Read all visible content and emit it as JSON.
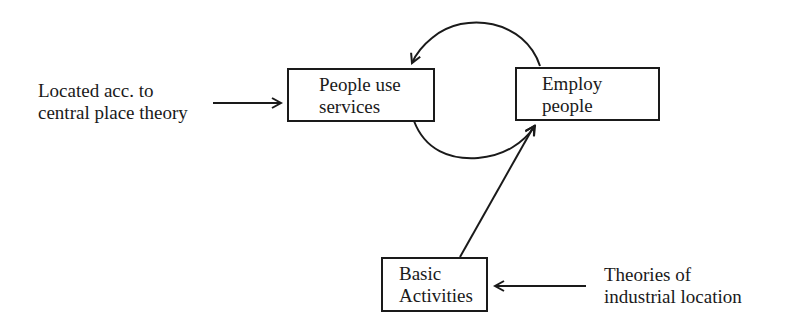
{
  "diagram": {
    "nodes": [
      {
        "id": "people-use-services",
        "lines": [
          "People use",
          "services"
        ]
      },
      {
        "id": "employ-people",
        "lines": [
          "Employ",
          "people"
        ]
      },
      {
        "id": "basic-activities",
        "lines": [
          "Basic",
          "Activities"
        ]
      }
    ],
    "inputs": [
      {
        "id": "central-place",
        "lines": [
          "Located acc. to",
          "central place theory"
        ],
        "target": "people-use-services"
      },
      {
        "id": "industrial-location",
        "lines": [
          "Theories of",
          "industrial location"
        ],
        "target": "basic-activities"
      }
    ],
    "edges": [
      {
        "from": "employ-people",
        "to": "people-use-services",
        "style": "arc-top"
      },
      {
        "from": "people-use-services",
        "to": "employ-people",
        "style": "arc-bottom"
      },
      {
        "from": "basic-activities",
        "to": "employ-people",
        "style": "straight"
      },
      {
        "from": "central-place",
        "to": "people-use-services",
        "style": "straight"
      },
      {
        "from": "industrial-location",
        "to": "basic-activities",
        "style": "straight"
      }
    ],
    "colors": {
      "stroke": "#1a1a1a",
      "background": "#ffffff"
    }
  }
}
